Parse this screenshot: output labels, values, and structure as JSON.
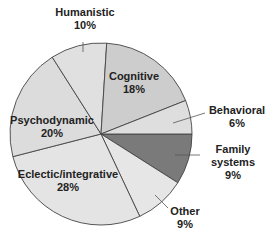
{
  "chart_data": {
    "type": "pie",
    "title": "",
    "start_angle_deg": 0,
    "direction": "clockwise",
    "slices": [
      {
        "label": "Family systems",
        "value": 9,
        "display": "9%",
        "color": "#7a7a7a"
      },
      {
        "label": "Other",
        "value": 9,
        "display": "9%",
        "color": "#e6e6e6"
      },
      {
        "label": "Eclectic/integrative",
        "value": 28,
        "display": "28%",
        "color": "#e4e4e4"
      },
      {
        "label": "Psychodynamic",
        "value": 20,
        "display": "20%",
        "color": "#dcdcdc"
      },
      {
        "label": "Humanistic",
        "value": 10,
        "display": "10%",
        "color": "#e0e0e0"
      },
      {
        "label": "Cognitive",
        "value": 18,
        "display": "18%",
        "color": "#cdcdcd"
      },
      {
        "label": "Behavioral",
        "value": 6,
        "display": "6%",
        "color": "#dedede"
      }
    ],
    "labels": {
      "family_name_1": "Family",
      "family_name_2": "systems",
      "family_pct": "9%",
      "other_name": "Other",
      "other_pct": "9%",
      "eclectic_name": "Eclectic/integrative",
      "eclectic_pct": "28%",
      "psycho_name": "Psychodynamic",
      "psycho_pct": "20%",
      "humanistic_name": "Humanistic",
      "humanistic_pct": "10%",
      "cognitive_name": "Cognitive",
      "cognitive_pct": "18%",
      "behavioral_name": "Behavioral",
      "behavioral_pct": "6%"
    }
  }
}
